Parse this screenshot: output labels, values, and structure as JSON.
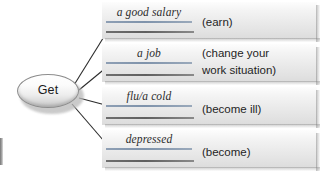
{
  "diagram": {
    "center": {
      "label": "Get",
      "name": "central-node"
    },
    "branches": [
      {
        "answer": "a good salary",
        "gloss": "(earn)",
        "gloss_line2": ""
      },
      {
        "answer": "a job",
        "gloss": "(change your",
        "gloss_line2": "work situation)"
      },
      {
        "answer": "flu/a cold",
        "gloss": "(become ill)",
        "gloss_line2": ""
      },
      {
        "answer": "depressed",
        "gloss": "(become)",
        "gloss_line2": ""
      }
    ],
    "colors": {
      "rule_top": "#7f93ab",
      "rule_bottom": "#5f5f5f",
      "band_fill": "#eaeaea",
      "connector": "#2b2b2b",
      "text": "#1f1f1f"
    }
  }
}
